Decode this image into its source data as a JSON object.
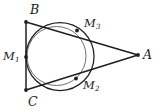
{
  "figure": {
    "kind": "geometry-diagram",
    "background_color": "#ffffff",
    "stroke_color": "#1a1a1a",
    "secondary_stroke_color": "#555555",
    "width": 160,
    "height": 111
  },
  "labels": {
    "A": {
      "text": "A",
      "sub": ""
    },
    "B": {
      "text": "B",
      "sub": ""
    },
    "C": {
      "text": "C",
      "sub": ""
    },
    "M1": {
      "text": "M",
      "sub": "1"
    },
    "M2": {
      "text": "M",
      "sub": "2"
    },
    "M3": {
      "text": "M",
      "sub": "3"
    }
  },
  "points": {
    "A": {
      "x": 138,
      "y": 55
    },
    "B": {
      "x": 26,
      "y": 22
    },
    "C": {
      "x": 26,
      "y": 90
    },
    "M1": {
      "x": 26,
      "y": 57
    },
    "M2": {
      "x": 76,
      "y": 79
    },
    "M3": {
      "x": 77,
      "y": 31
    }
  },
  "segments": [
    {
      "name": "BC",
      "from": "B",
      "to": "C"
    },
    {
      "name": "BA",
      "from": "B",
      "to": "A"
    },
    {
      "name": "CA",
      "from": "C",
      "to": "A"
    }
  ],
  "circles": [
    {
      "name": "incircle",
      "cx": 60,
      "cy": 57,
      "r": 34
    },
    {
      "name": "second-circle",
      "cx": 56,
      "cy": 56,
      "r": 30
    }
  ]
}
